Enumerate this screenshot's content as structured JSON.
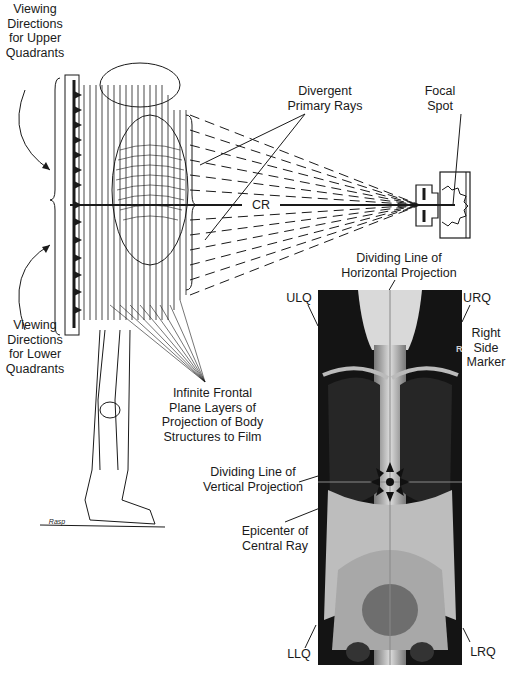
{
  "labels": {
    "viewing_upper": "Viewing\nDirections\nfor Upper\nQuadrants",
    "viewing_lower": "Viewing\nDirections\nfor Lower\nQuadrants",
    "divergent_rays": "Divergent\nPrimary Rays",
    "focal_spot": "Focal\nSpot",
    "cr": "CR",
    "horizontal_line": "Dividing Line of\nHorizontal Projection",
    "ulq": "ULQ",
    "urq": "URQ",
    "right_marker": "Right\nSide\nMarker",
    "frontal_planes": "Infinite Frontal\nPlane Layers of\nProjection of Body\nStructures to Film",
    "vertical_line": "Dividing Line of\nVertical Projection",
    "epicenter": "Epicenter of\nCentral Ray",
    "llq": "LLQ",
    "lrq": "LRQ",
    "marker_glyph": "R",
    "signature": "Rasp"
  },
  "colors": {
    "ink": "#1a1a1a",
    "xray_dark": "#141414",
    "xray_light": "#d9d9d9",
    "background": "#ffffff"
  },
  "icons": {
    "viewing_arrow": "arrowhead-triangle",
    "epicenter_star": "eight-point-arrow-star"
  }
}
